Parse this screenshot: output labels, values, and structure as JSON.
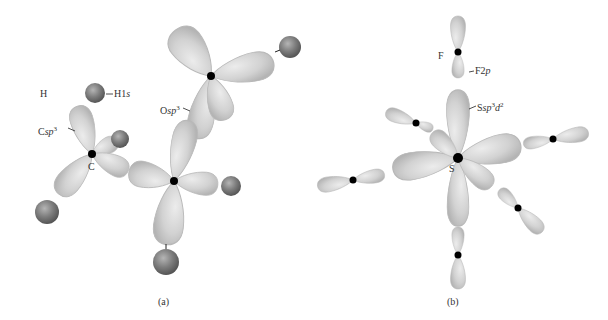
{
  "panels": [
    {
      "id": "a",
      "caption": "(a)",
      "description": "Methanol-like molecule with sp3 hybrid orbitals",
      "labels": {
        "h_atom": "H",
        "h_orbital_base": "H1",
        "h_orbital_sub": "s",
        "c_orbital_base": "C",
        "c_orbital_sub": "sp",
        "c_orbital_sup": "3",
        "c_atom": "C",
        "o_orbital_base": "O",
        "o_orbital_sub": "sp",
        "o_orbital_sup": "3"
      }
    },
    {
      "id": "b",
      "caption": "(b)",
      "description": "SF6 with sp3d2 hybrid orbitals",
      "labels": {
        "f_atom": "F",
        "f_orbital_base": "F2",
        "f_orbital_sub": "p",
        "s_orbital_base": "S",
        "s_orbital_sub": "sp",
        "s_orbital_sup1": "3",
        "s_orbital_mid": "d",
        "s_orbital_sup2": "2",
        "s_atom": "S"
      }
    }
  ],
  "colors": {
    "lobe": "#d4d4d4",
    "lobe_edge": "#b0b0b0",
    "sphere": "#7a7a7a",
    "nucleus": "#000000",
    "text": "#333333"
  }
}
